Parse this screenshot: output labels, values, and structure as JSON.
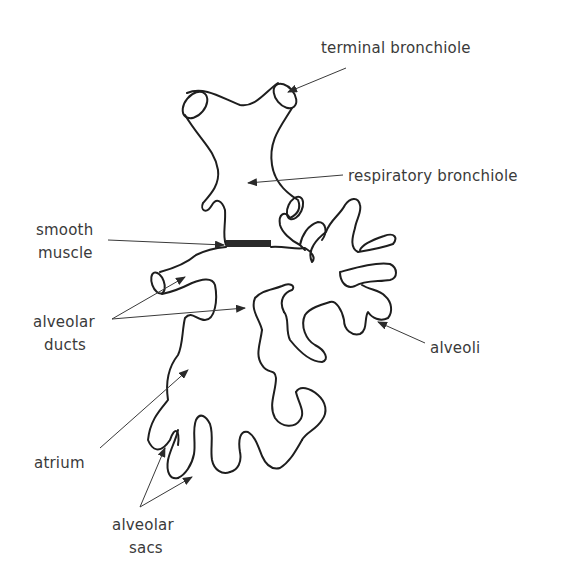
{
  "diagram": {
    "labels": {
      "terminal_bronchiole": "terminal bronchiole",
      "respiratory_bronchiole": "respiratory bronchiole",
      "smooth_muscle_line1": "smooth",
      "smooth_muscle_line2": "muscle",
      "alveolar_ducts_line1": "alveolar",
      "alveolar_ducts_line2": "ducts",
      "alveoli": "alveoli",
      "atrium": "atrium",
      "alveolar_sacs_line1": "alveolar",
      "alveolar_sacs_line2": "sacs"
    },
    "colors": {
      "background": "#ffffff",
      "outline": "#1e1e1e",
      "label_text": "#3a3a3a"
    }
  }
}
